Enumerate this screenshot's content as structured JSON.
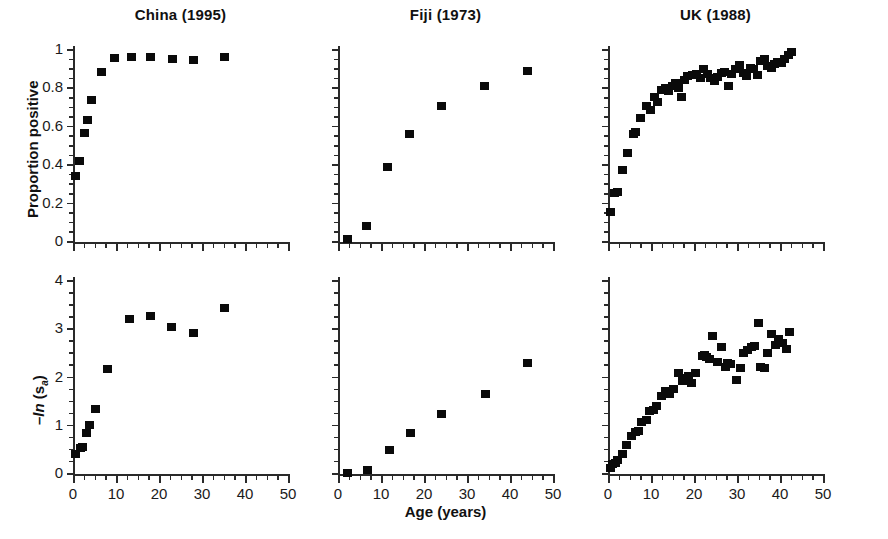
{
  "figure": {
    "background": "#ffffff",
    "marker_color": "#0a0a0a",
    "axis_color": "#2a2a2a",
    "xlabel": "Age (years)",
    "ylabel_top": "Proportion positive",
    "ylabel_bottom_prefix": "–",
    "ylabel_bottom_ln": "ln",
    "ylabel_bottom_open": " (s",
    "ylabel_bottom_sub": "a",
    "ylabel_bottom_close": ")"
  },
  "titles": {
    "china": "China (1995)",
    "fiji": "Fiji (1973)",
    "uk": "UK (1988)"
  },
  "axis_labels": {
    "x_ticks": [
      "0",
      "10",
      "20",
      "30",
      "40",
      "50"
    ],
    "y_ticks_top": [
      "0",
      "0.2",
      "0.4",
      "0.6",
      "0.8",
      "1"
    ],
    "y_ticks_bottom": [
      "0",
      "1",
      "2",
      "3",
      "4"
    ]
  },
  "chart_data": [
    {
      "type": "scatter",
      "title": "China (1995)",
      "panel": "top-left",
      "xlabel": "Age (years)",
      "ylabel": "Proportion positive",
      "xlim": [
        0,
        50
      ],
      "ylim": [
        0,
        1
      ],
      "xticks": [
        0,
        10,
        20,
        30,
        40,
        50
      ],
      "yticks": [
        0,
        0.2,
        0.4,
        0.6,
        0.8,
        1
      ],
      "minor_tick_interval_x": 2.5,
      "minor_tick_interval_y": 0.05,
      "grid": false,
      "legend": null,
      "x": [
        0.5,
        1.5,
        2.5,
        3.2,
        4.2,
        6.5,
        9.5,
        13.5,
        18.0,
        23.0,
        28.0,
        35.0
      ],
      "y": [
        0.345,
        0.42,
        0.57,
        0.635,
        0.74,
        0.885,
        0.96,
        0.962,
        0.962,
        0.952,
        0.948,
        0.965
      ]
    },
    {
      "type": "scatter",
      "title": "Fiji (1973)",
      "panel": "top-middle",
      "xlabel": "Age (years)",
      "ylabel": "Proportion positive",
      "xlim": [
        0,
        50
      ],
      "ylim": [
        0,
        1
      ],
      "xticks": [
        0,
        10,
        20,
        30,
        40,
        50
      ],
      "yticks": [
        0,
        0.2,
        0.4,
        0.6,
        0.8,
        1
      ],
      "minor_tick_interval_x": 2.5,
      "minor_tick_interval_y": 0.05,
      "grid": false,
      "legend": null,
      "x": [
        2.0,
        6.5,
        11.5,
        16.5,
        24.0,
        34.0,
        44.0
      ],
      "y": [
        0.015,
        0.085,
        0.39,
        0.56,
        0.71,
        0.81,
        0.89
      ]
    },
    {
      "type": "scatter",
      "title": "UK (1988)",
      "panel": "top-right",
      "xlabel": "Age (years)",
      "ylabel": "Proportion positive",
      "xlim": [
        0,
        50
      ],
      "ylim": [
        0,
        1
      ],
      "xticks": [
        0,
        10,
        20,
        30,
        40,
        50
      ],
      "yticks": [
        0,
        0.2,
        0.4,
        0.6,
        0.8,
        1
      ],
      "minor_tick_interval_x": 2.5,
      "minor_tick_interval_y": 0.05,
      "grid": false,
      "legend": null,
      "x": [
        0.5,
        1.3,
        2.0,
        3.2,
        4.5,
        5.7,
        6.3,
        7.5,
        8.8,
        9.8,
        10.8,
        11.5,
        12.3,
        13.2,
        14.0,
        14.8,
        15.6,
        16.2,
        16.9,
        17.6,
        18.3,
        19.5,
        20.5,
        21.5,
        22.2,
        23.0,
        23.8,
        24.6,
        25.4,
        26.2,
        27.0,
        27.8,
        28.6,
        29.6,
        30.5,
        31.4,
        32.2,
        33.0,
        33.8,
        34.6,
        35.4,
        36.2,
        37.0,
        37.8,
        38.6,
        39.4,
        40.2,
        41.0,
        41.8,
        42.6
      ],
      "y": [
        0.155,
        0.255,
        0.26,
        0.375,
        0.465,
        0.565,
        0.575,
        0.645,
        0.71,
        0.685,
        0.755,
        0.73,
        0.79,
        0.8,
        0.785,
        0.81,
        0.83,
        0.8,
        0.755,
        0.845,
        0.865,
        0.87,
        0.875,
        0.855,
        0.9,
        0.875,
        0.855,
        0.84,
        0.86,
        0.88,
        0.885,
        0.81,
        0.875,
        0.9,
        0.92,
        0.88,
        0.865,
        0.905,
        0.9,
        0.87,
        0.945,
        0.955,
        0.915,
        0.905,
        0.925,
        0.935,
        0.93,
        0.955,
        0.975,
        0.99
      ]
    },
    {
      "type": "scatter",
      "title": "China (1995)",
      "panel": "bottom-left",
      "xlabel": "Age (years)",
      "ylabel": "-ln (s_a)",
      "xlim": [
        0,
        50
      ],
      "ylim": [
        0,
        4
      ],
      "xticks": [
        0,
        10,
        20,
        30,
        40,
        50
      ],
      "yticks": [
        0,
        1,
        2,
        3,
        4
      ],
      "minor_tick_interval_x": 2.5,
      "minor_tick_interval_y": 0.25,
      "grid": false,
      "legend": null,
      "x": [
        0.4,
        1.6,
        2.0,
        3.0,
        3.8,
        5.0,
        8.0,
        13.0,
        18.0,
        22.8,
        28.0,
        35.2
      ],
      "y": [
        0.42,
        0.53,
        0.55,
        0.86,
        1.01,
        1.35,
        2.17,
        3.22,
        3.28,
        3.05,
        2.92,
        3.45
      ]
    },
    {
      "type": "scatter",
      "title": "Fiji (1973)",
      "panel": "bottom-middle",
      "xlabel": "Age (years)",
      "ylabel": "-ln (s_a)",
      "xlim": [
        0,
        50
      ],
      "ylim": [
        0,
        4
      ],
      "xticks": [
        0,
        10,
        20,
        30,
        40,
        50
      ],
      "yticks": [
        0,
        1,
        2,
        3,
        4
      ],
      "minor_tick_interval_x": 2.5,
      "minor_tick_interval_y": 0.25,
      "grid": false,
      "legend": null,
      "x": [
        2.0,
        6.7,
        11.8,
        16.8,
        24.0,
        34.2,
        44.0
      ],
      "y": [
        0.02,
        0.09,
        0.5,
        0.85,
        1.25,
        1.65,
        2.3
      ]
    },
    {
      "type": "scatter",
      "title": "UK (1988)",
      "panel": "bottom-right",
      "xlabel": "Age (years)",
      "ylabel": "-ln (s_a)",
      "xlim": [
        0,
        50
      ],
      "ylim": [
        0,
        4
      ],
      "xticks": [
        0,
        10,
        20,
        30,
        40,
        50
      ],
      "yticks": [
        0,
        1,
        2,
        3,
        4
      ],
      "minor_tick_interval_x": 2.5,
      "minor_tick_interval_y": 0.25,
      "grid": false,
      "legend": null,
      "x": [
        0.4,
        1.0,
        1.6,
        2.2,
        3.2,
        4.2,
        5.3,
        6.3,
        6.9,
        7.7,
        8.8,
        9.6,
        10.4,
        11.2,
        12.3,
        13.2,
        14.2,
        15.0,
        16.2,
        17.3,
        17.9,
        18.5,
        19.2,
        20.3,
        21.8,
        22.3,
        22.9,
        23.6,
        24.2,
        25.3,
        26.2,
        27.1,
        27.7,
        28.4,
        29.8,
        30.7,
        31.5,
        32.3,
        33.2,
        33.9,
        34.8,
        35.4,
        36.3,
        37.0,
        37.8,
        38.8,
        39.5,
        40.5,
        41.3,
        42.0
      ],
      "y": [
        0.13,
        0.2,
        0.23,
        0.3,
        0.42,
        0.6,
        0.78,
        0.88,
        0.9,
        1.07,
        1.12,
        1.3,
        1.33,
        1.41,
        1.62,
        1.72,
        1.65,
        1.77,
        2.1,
        1.93,
        1.98,
        2.03,
        1.88,
        2.1,
        2.45,
        2.47,
        2.42,
        2.38,
        2.85,
        2.32,
        2.63,
        2.22,
        2.3,
        2.28,
        1.95,
        2.2,
        2.5,
        2.58,
        2.63,
        2.65,
        3.12,
        2.22,
        2.2,
        2.5,
        2.9,
        2.68,
        2.8,
        2.72,
        2.6,
        2.95
      ]
    }
  ]
}
